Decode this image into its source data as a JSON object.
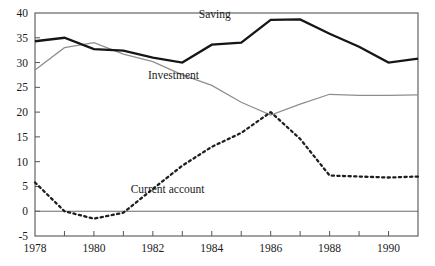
{
  "chart_data": {
    "type": "line",
    "title": "",
    "xlabel": "",
    "ylabel": "",
    "xlim": [
      1978,
      1991
    ],
    "ylim": [
      -5,
      40
    ],
    "ytick_values": [
      -5,
      0,
      5,
      10,
      15,
      20,
      25,
      30,
      35,
      40
    ],
    "ytick_labels": [
      "-5",
      "0",
      "5",
      "10",
      "15",
      "20",
      "25",
      "30",
      "35",
      "40"
    ],
    "xtick_values": [
      1978,
      1979,
      1980,
      1981,
      1982,
      1983,
      1984,
      1985,
      1986,
      1987,
      1988,
      1989,
      1990,
      1991
    ],
    "xtick_labels": [
      "1978",
      "",
      "1980",
      "",
      "1982",
      "",
      "1984",
      "",
      "1986",
      "",
      "1988",
      "",
      "1990",
      ""
    ],
    "xtick_labels_shown": [
      "1978",
      "1980",
      "1982",
      "1984",
      "1986",
      "1988",
      "1990"
    ],
    "grid": false,
    "legend": "inline-annotations",
    "zero_line": 0,
    "x": [
      1978,
      1979,
      1980,
      1981,
      1982,
      1983,
      1984,
      1985,
      1986,
      1987,
      1988,
      1989,
      1990,
      1991
    ],
    "series": [
      {
        "name": "Saving",
        "style": "thick-solid-black",
        "color": "#161616",
        "label_x": 1984.1,
        "label_y": 39.0,
        "values": [
          34.3,
          35.0,
          32.7,
          32.4,
          31.0,
          30.0,
          33.6,
          34.0,
          38.6,
          38.7,
          35.8,
          33.2,
          30.0,
          30.8
        ]
      },
      {
        "name": "Investment",
        "style": "thin-solid-gray",
        "color": "#8e8e8e",
        "label_x": 1982.7,
        "label_y": 26.6,
        "values": [
          28.5,
          33.0,
          34.0,
          31.7,
          30.2,
          27.5,
          25.4,
          22.0,
          19.4,
          21.6,
          23.6,
          23.4,
          23.4,
          23.5
        ]
      },
      {
        "name": "Current account",
        "style": "dotted-black",
        "color": "#1f1f1f",
        "label_x": 1982.5,
        "label_y": 3.6,
        "values": [
          5.8,
          0.0,
          -1.5,
          -0.3,
          4.5,
          9.2,
          13.0,
          15.8,
          20.0,
          14.6,
          7.2,
          7.0,
          6.8,
          7.0
        ]
      }
    ]
  },
  "annotations": {
    "saving_label": "Saving",
    "investment_label": "Investment",
    "current_account_label": "Current account"
  },
  "axes": {
    "plot_left_px": 35,
    "plot_right_px": 418,
    "plot_top_px": 13,
    "plot_bottom_px": 236
  }
}
